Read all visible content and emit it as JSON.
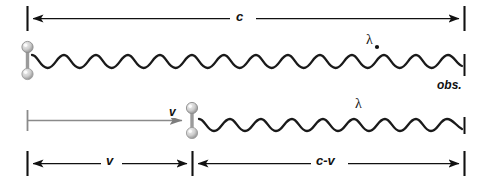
{
  "figure": {
    "background_color": "#ffffff",
    "ink_color": "#111111",
    "gray_color": "#8a8a8a",
    "width": 484,
    "height": 180
  },
  "rows": {
    "top": {
      "name": "stationary-source-row",
      "dimension_label": "c",
      "wavelength_label": "λ",
      "observer_label": "obs.",
      "wave_cycles": 10,
      "wave_start_x": 34,
      "wave_end_x": 464,
      "source_x": 28
    },
    "bottom": {
      "name": "moving-source-row",
      "velocity_label": "v",
      "wavelength_label": "λ",
      "dimension_left_label": "v",
      "dimension_right_label": "c-v",
      "wave_cycles": 6,
      "wave_start_x": 200,
      "wave_end_x": 464,
      "source_x": 192
    }
  },
  "dimensions": {
    "top_arrow": {
      "from_x": 27,
      "to_x": 465,
      "y": 18,
      "label": "c"
    },
    "velocity_arrow": {
      "from_x": 27,
      "to_x": 190,
      "y": 120,
      "label": "v"
    },
    "bottom_left": {
      "from_x": 27,
      "to_x": 190,
      "y": 163,
      "label": "v"
    },
    "bottom_right": {
      "from_x": 194,
      "to_x": 465,
      "y": 163,
      "label": "c-v"
    }
  }
}
